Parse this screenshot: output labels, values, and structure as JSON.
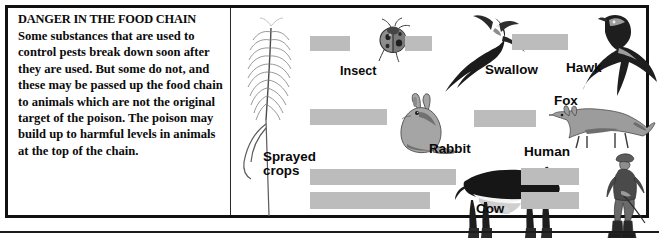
{
  "panel": {
    "title": "DANGER IN THE FOOD CHAIN",
    "body": "Some substances that are used to control pests break down soon after they are used. But some do not, and these may be passed up the food chain to animals which are not the original target of the poison. The poison may build up to harmful levels in animals at the top of the chain.",
    "border_color": "#111111",
    "text_color": "#0b0b0b"
  },
  "diagram": {
    "type": "food-chain-flow",
    "arrow_color": "#bcbcbc",
    "labels": {
      "crops": "Sprayed\ncrops",
      "insect": "Insect",
      "swallow": "Swallow",
      "hawk": "Hawk",
      "rabbit": "Rabbit",
      "fox": "Fox",
      "cow": "Cow",
      "human": "Human"
    },
    "chains": [
      [
        "Sprayed crops",
        "Insect",
        "Swallow",
        "Hawk"
      ],
      [
        "Sprayed crops",
        "Rabbit",
        "Fox"
      ],
      [
        "Sprayed crops",
        "Cow",
        "Human"
      ]
    ],
    "artwork": [
      "wheat-ear-illustration",
      "ladybird-beetle-illustration",
      "swallow-bird-illustration",
      "hawk-bird-illustration",
      "rabbit-illustration",
      "fox-illustration",
      "cow-illustration",
      "human-figure-illustration"
    ]
  }
}
